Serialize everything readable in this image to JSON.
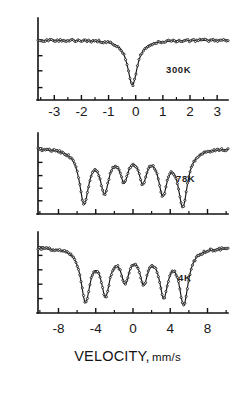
{
  "figure": {
    "title": "",
    "xlabel_main": "VELOCITY,",
    "xlabel_units": "mm/s",
    "background": "#ffffff",
    "ink": "#151515"
  },
  "chart_data": {
    "type": "line",
    "title": "",
    "xlabel": "VELOCITY, mm/s",
    "ylabel": "",
    "grid": false,
    "legend": "none",
    "panels": [
      {
        "name": "300K",
        "annotation": "300K",
        "xlim": [
          -3.6,
          3.4
        ],
        "xticks_major": [
          -3,
          -2,
          -1,
          0,
          1,
          2,
          3
        ],
        "xticklabels": [
          "-3",
          "-2",
          "-1",
          "0",
          "1",
          "2",
          "3"
        ],
        "xticks_minor": [
          -3.5,
          -2.5,
          -1.5,
          -0.5,
          0.5,
          1.5,
          2.5
        ],
        "ylim": [
          0.0,
          1.06
        ],
        "ybaseline": 1.0,
        "yticks": [
          0.15,
          0.45,
          0.72,
          1.0
        ],
        "series_type": "single-line-absorption",
        "peaks": [
          {
            "center": -0.12,
            "depth": 0.8,
            "width": 0.22
          }
        ],
        "points_n": 128
      },
      {
        "name": "78K",
        "annotation": "78K",
        "xlim": [
          -10.2,
          10.2
        ],
        "xticks_major": [
          -8,
          -4,
          0,
          4,
          8
        ],
        "xticks_minor": [
          -10,
          -6,
          -2,
          2,
          6,
          10
        ],
        "ylim": [
          0.0,
          1.06
        ],
        "ybaseline": 1.0,
        "yticks": [
          0.12,
          0.33,
          0.54,
          0.76,
          1.0
        ],
        "series_type": "sextet",
        "peaks": [
          {
            "center": -5.25,
            "depth": 0.88,
            "width": 0.62
          },
          {
            "center": -3.05,
            "depth": 0.66,
            "width": 0.58
          },
          {
            "center": -0.95,
            "depth": 0.47,
            "width": 0.52
          },
          {
            "center": 1.05,
            "depth": 0.49,
            "width": 0.52
          },
          {
            "center": 3.2,
            "depth": 0.69,
            "width": 0.58
          },
          {
            "center": 5.35,
            "depth": 0.92,
            "width": 0.62
          }
        ],
        "points_n": 150
      },
      {
        "name": "4K",
        "annotation": "4K",
        "xlim": [
          -10.2,
          10.2
        ],
        "xticks_major": [
          -8,
          -4,
          0,
          4,
          8
        ],
        "xticks_minor": [
          -10,
          -6,
          -2,
          2,
          6,
          10
        ],
        "ylim": [
          0.0,
          1.06
        ],
        "ybaseline": 1.0,
        "yticks": [
          0.14,
          0.38,
          0.62,
          0.86,
          1.0
        ],
        "series_type": "sextet",
        "peaks": [
          {
            "center": -5.1,
            "depth": 0.86,
            "width": 0.6
          },
          {
            "center": -2.95,
            "depth": 0.72,
            "width": 0.58
          },
          {
            "center": -0.85,
            "depth": 0.5,
            "width": 0.52
          },
          {
            "center": 1.15,
            "depth": 0.52,
            "width": 0.52
          },
          {
            "center": 3.3,
            "depth": 0.74,
            "width": 0.58
          },
          {
            "center": 5.45,
            "depth": 0.9,
            "width": 0.6
          }
        ],
        "points_n": 150
      }
    ],
    "bottom_axis": {
      "xticks_major": [
        -8,
        -4,
        0,
        4,
        8
      ],
      "xticklabels": [
        "-8",
        "-4",
        "0",
        "4",
        "8"
      ],
      "xticks_minor": [
        -10,
        -6,
        -2,
        2,
        6,
        10
      ]
    }
  }
}
